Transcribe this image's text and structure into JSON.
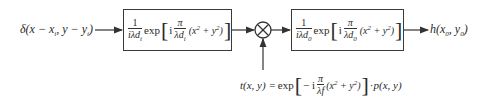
{
  "diagram": {
    "input": {
      "label": "δ(x − x_i, y − y_i)",
      "parts": {
        "delta": "δ",
        "open": "(x − x",
        "sub1": "i",
        "mid": ", y − y",
        "sub2": "i",
        "close": ")"
      }
    },
    "block1": {
      "frac1_num": "1",
      "frac1_den": "iλd",
      "frac1_den_sub": "i",
      "exp": "exp",
      "i": "i",
      "frac2_num": "π",
      "frac2_den": "λd",
      "frac2_den_sub": "i",
      "arg": "(x",
      "sup1": "2",
      "plus": " + y",
      "sup2": "2",
      "close": ")"
    },
    "multiplier": {
      "symbol": "×"
    },
    "block2": {
      "frac1_num": "1",
      "frac1_den": "iλd",
      "frac1_den_sub": "0",
      "exp": "exp",
      "i": "i",
      "frac2_num": "π",
      "frac2_den": "λd",
      "frac2_den_sub": "0",
      "arg": "(x",
      "sup1": "2",
      "plus": " + y",
      "sup2": "2",
      "close": ")"
    },
    "output": {
      "label": "h(x_0, y_0)",
      "parts": {
        "h": "h(x",
        "sub1": "0",
        "mid": ", y",
        "sub2": "0",
        "close": ")"
      }
    },
    "transmission": {
      "lhs": "t(x, y) = ",
      "exp": "exp",
      "minus_i": " − i",
      "frac_num": "π",
      "frac_den": "λf",
      "arg": "(x",
      "sup1": "2",
      "plus": " + y",
      "sup2": "2",
      "close": ")",
      "dot": " · ",
      "pupil": "p(x, y)"
    }
  }
}
